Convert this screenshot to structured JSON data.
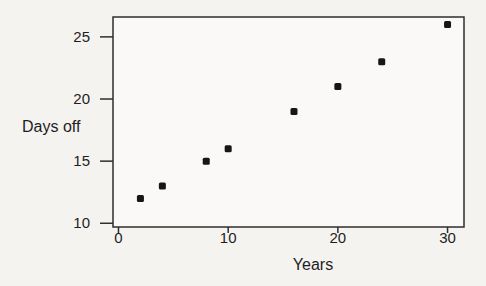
{
  "chart_data": {
    "type": "scatter",
    "title": "",
    "xlabel": "Years",
    "ylabel": "Days off",
    "x_ticks": [
      0,
      10,
      20,
      30
    ],
    "y_ticks": [
      10,
      15,
      20,
      25
    ],
    "xlim": [
      -0.5,
      31.5
    ],
    "ylim": [
      9.7,
      26.6
    ],
    "grid": false,
    "legend": "none",
    "points": [
      {
        "x": 2,
        "y": 12
      },
      {
        "x": 4,
        "y": 13
      },
      {
        "x": 8,
        "y": 15
      },
      {
        "x": 10,
        "y": 16
      },
      {
        "x": 16,
        "y": 19
      },
      {
        "x": 20,
        "y": 21
      },
      {
        "x": 24,
        "y": 23
      },
      {
        "x": 30,
        "y": 26
      }
    ],
    "marker": {
      "shape": "square",
      "color": "#161616",
      "size": 7
    },
    "colors": {
      "background": "#f4f3f0",
      "axis": "#2e2e2e",
      "text": "#1e1e1e"
    }
  }
}
